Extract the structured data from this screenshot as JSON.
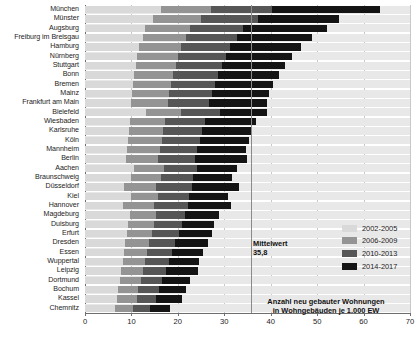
{
  "chart_data": {
    "type": "bar",
    "orientation": "horizontal",
    "stacked": true,
    "title": "",
    "subtitle": "",
    "xlabel": "Anzahl neu gebauter Wohnungen\nin Wohngebäuden je 1.000 EW",
    "ylabel": "",
    "xlim": [
      0,
      70
    ],
    "xticks": [
      0,
      10,
      20,
      30,
      40,
      50,
      60,
      70
    ],
    "xticklabels": [
      "0",
      "10",
      "20",
      "30",
      "40",
      "50",
      "60",
      "70"
    ],
    "grid": true,
    "legend_position": "right",
    "legend_entries": [
      "2002-2005",
      "2006-2009",
      "2010-2013",
      "2014-2017"
    ],
    "colors": [
      "#d9d9d9",
      "#949494",
      "#565656",
      "#141414"
    ],
    "annotations": [
      {
        "label": "Mittelwert",
        "value": "35,8",
        "value_number": 35.8,
        "type": "reference-line"
      }
    ],
    "categories": [
      "München",
      "Münster",
      "Augsburg",
      "Freiburg im Breisgau",
      "Hamburg",
      "Nürnberg",
      "Stuttgart",
      "Bonn",
      "Bremen",
      "Mainz",
      "Frankfurt am Main",
      "Bielefeld",
      "Wiesbaden",
      "Karlsruhe",
      "Köln",
      "Mannheim",
      "Berlin",
      "Aachen",
      "Braunschweig",
      "Düsseldorf",
      "Kiel",
      "Hannover",
      "Magdeburg",
      "Duisburg",
      "Erfurt",
      "Dresden",
      "Essen",
      "Wuppertal",
      "Leipzig",
      "Dortmund",
      "Bochum",
      "Kassel",
      "Chemnitz"
    ],
    "series": [
      {
        "name": "2002-2005",
        "color": "#d9d9d9",
        "values": [
          16.3,
          14.6,
          13.0,
          12.4,
          11.6,
          11.3,
          10.9,
          10.6,
          10.4,
          10.2,
          9.9,
          13.1,
          9.6,
          9.4,
          9.2,
          9.0,
          8.8,
          10.5,
          10.0,
          8.3,
          9.8,
          8.1,
          9.6,
          9.3,
          9.0,
          8.6,
          8.4,
          8.1,
          7.8,
          7.5,
          7.2,
          6.9,
          6.4
        ]
      },
      {
        "name": "2006-2009",
        "color": "#949494",
        "values": [
          10.8,
          10.3,
          9.6,
          9.4,
          9.0,
          8.8,
          8.6,
          8.4,
          8.2,
          8.0,
          7.9,
          7.6,
          7.7,
          7.5,
          7.3,
          7.2,
          7.0,
          6.5,
          6.3,
          7.1,
          6.0,
          6.8,
          5.7,
          5.5,
          5.4,
          5.2,
          5.0,
          4.8,
          4.7,
          4.5,
          4.3,
          4.2,
          3.9
        ]
      },
      {
        "name": "2010-2013",
        "color": "#565656",
        "values": [
          13.2,
          12.4,
          11.5,
          11.0,
          10.6,
          10.3,
          10.0,
          9.7,
          9.5,
          9.2,
          9.0,
          8.3,
          8.6,
          8.4,
          8.2,
          8.0,
          7.8,
          7.2,
          7.0,
          7.6,
          6.7,
          7.3,
          6.3,
          6.0,
          5.8,
          5.6,
          5.3,
          5.1,
          4.9,
          4.6,
          4.4,
          4.2,
          3.7
        ]
      },
      {
        "name": "2014-2017",
        "color": "#141414",
        "values": [
          23.2,
          17.4,
          18.0,
          16.1,
          15.3,
          14.1,
          13.6,
          13.0,
          12.5,
          12.2,
          12.5,
          10.1,
          11.0,
          10.6,
          10.6,
          10.5,
          11.2,
          8.5,
          8.4,
          10.2,
          8.2,
          9.3,
          7.3,
          7.0,
          7.2,
          7.1,
          6.8,
          6.5,
          7.0,
          6.1,
          5.8,
          5.5,
          4.3
        ]
      }
    ],
    "totals": [
      63.5,
      54.7,
      52.1,
      48.9,
      46.5,
      44.5,
      43.1,
      41.7,
      40.6,
      39.6,
      39.3,
      39.1,
      36.9,
      35.9,
      35.3,
      34.7,
      34.8,
      32.7,
      31.7,
      33.2,
      30.7,
      31.5,
      28.9,
      27.8,
      27.4,
      26.5,
      25.5,
      24.5,
      24.4,
      22.7,
      21.7,
      20.8,
      18.3
    ]
  }
}
